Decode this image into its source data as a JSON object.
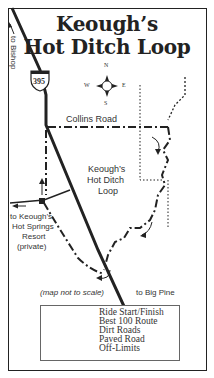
{
  "title": {
    "line1": "Keough’s",
    "line2": "Hot Ditch Loop"
  },
  "compass": {
    "n": "N",
    "s": "S",
    "e": "E",
    "w": "W"
  },
  "labels": {
    "to_bishop": "to Bishop",
    "highway": "395",
    "collins_road": "Collins Road",
    "loop_name_1": "Keough’s",
    "loop_name_2": "Hot Ditch",
    "loop_name_3": "Loop",
    "resort_1": "to Keough’s",
    "resort_2": "Hot Springs",
    "resort_3": "Resort",
    "resort_4": "(private)",
    "not_to_scale": "(map not to scale)",
    "to_big_pine": "to Big Pine"
  },
  "legend": {
    "items": [
      {
        "symbol": "square",
        "label": "Ride Start/Finish"
      },
      {
        "symbol": "dash-dot",
        "label": "Best 100 Route"
      },
      {
        "symbol": "dashed",
        "label": "Dirt Roads"
      },
      {
        "symbol": "solid",
        "label": "Paved Road"
      },
      {
        "symbol": "dotted",
        "label": "Off-Limits"
      }
    ]
  },
  "colors": {
    "ink": "#222222",
    "paper": "#ffffff"
  }
}
